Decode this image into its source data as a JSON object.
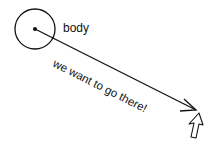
{
  "diagram": {
    "body_label": "body",
    "path_label": "we want to go there!",
    "colors": {
      "stroke": "#111111",
      "background": "#ffffff"
    }
  }
}
